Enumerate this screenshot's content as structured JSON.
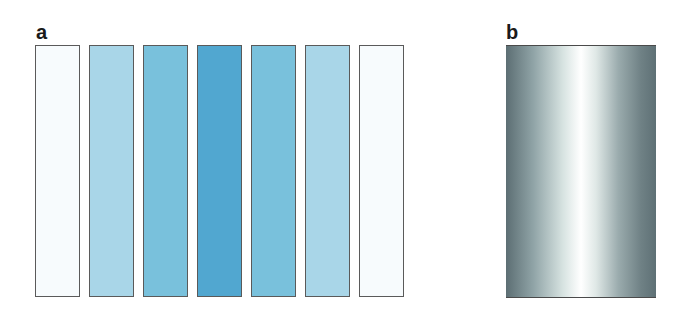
{
  "panels": {
    "a": {
      "label": "a",
      "bars": [
        {
          "left": 35,
          "color": "#f7fbfd"
        },
        {
          "left": 89,
          "color": "#a9d6e8"
        },
        {
          "left": 143,
          "color": "#79c1dc"
        },
        {
          "left": 197,
          "color": "#51a7d0"
        },
        {
          "left": 251,
          "color": "#79c1dc"
        },
        {
          "left": 305,
          "color": "#a9d6e8"
        },
        {
          "left": 359,
          "color": "#f7fbfd"
        }
      ]
    },
    "b": {
      "label": "b",
      "gradient_stops": [
        "#5c6e73",
        "#8fa3a6",
        "#d7e3e1",
        "#ffffff",
        "#dfe8e6",
        "#9aabad",
        "#6f8185",
        "#5e7075"
      ]
    }
  }
}
